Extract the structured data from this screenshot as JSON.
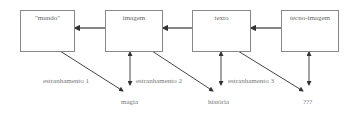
{
  "diagram": {
    "boxes": [
      {
        "id": "mundo",
        "label": "\"mundo\""
      },
      {
        "id": "imagem",
        "label": "imagem"
      },
      {
        "id": "texto",
        "label": "texto"
      },
      {
        "id": "tecno-imagem",
        "label": "tecno-imagem"
      }
    ],
    "outcomes": [
      {
        "id": "magia",
        "label": "magia"
      },
      {
        "id": "historia",
        "label": "história"
      },
      {
        "id": "unknown",
        "label": "???"
      }
    ],
    "edges": [
      {
        "from": "imagem",
        "to": "mundo",
        "type": "arrow"
      },
      {
        "from": "texto",
        "to": "imagem",
        "type": "arrow"
      },
      {
        "from": "tecno-imagem",
        "to": "texto",
        "type": "arrow"
      },
      {
        "from": "mundo",
        "to": "magia",
        "type": "arrow",
        "label": "estranhamento 1"
      },
      {
        "from": "imagem",
        "to": "magia",
        "type": "double-arrow"
      },
      {
        "from": "imagem",
        "to": "historia",
        "type": "arrow",
        "label": "estranhamento 2"
      },
      {
        "from": "texto",
        "to": "historia",
        "type": "double-arrow"
      },
      {
        "from": "texto",
        "to": "unknown",
        "type": "arrow",
        "label": "estranhamento 3"
      },
      {
        "from": "tecno-imagem",
        "to": "unknown",
        "type": "double-arrow"
      }
    ],
    "edge_labels": [
      "estranhamento 1",
      "estranhamento 2",
      "estranhamento 3"
    ]
  }
}
